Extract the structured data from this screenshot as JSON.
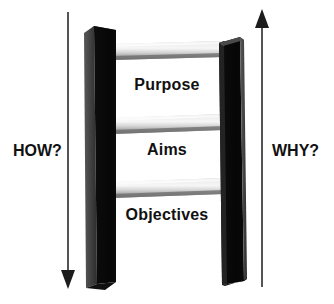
{
  "figure": {
    "type": "ladder-diagram",
    "background_color": "#ffffff",
    "description_name": "planning-ladder"
  },
  "ladder": {
    "rails": {
      "left_rail_name": "left-rail",
      "right_rail_name": "right-rail",
      "front_face_color": "#0b0b0b",
      "side_face_color": "#4a4a4a",
      "top_face_color": "#2a2a2a"
    },
    "rungs": [
      {
        "id": "rung-top",
        "label": "Purpose",
        "level": 3
      },
      {
        "id": "rung-middle",
        "label": "Aims",
        "level": 2
      },
      {
        "id": "rung-bottom",
        "label": "Objectives",
        "level": 1
      }
    ],
    "rung_colors": {
      "highlight": "#f2f2f2",
      "midtone": "#c9c9c9",
      "shadow": "#7d7d7d"
    }
  },
  "annotations": {
    "left": {
      "label": "HOW?",
      "arrow_name": "how-arrow-down",
      "arrow_direction": "down",
      "arrow_color": "#555555"
    },
    "right": {
      "label": "WHY?",
      "arrow_name": "why-arrow-up",
      "arrow_direction": "up",
      "arrow_color": "#555555"
    }
  },
  "text_color": "#111111"
}
